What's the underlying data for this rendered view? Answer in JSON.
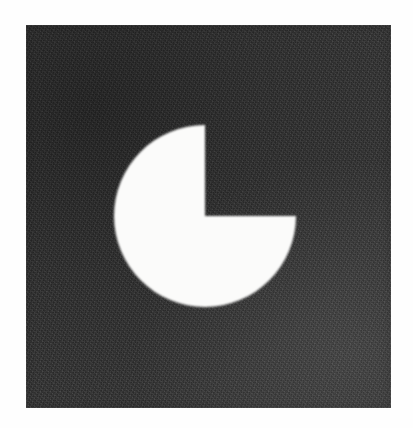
{
  "figure": {
    "canvas": {
      "width": 413,
      "height": 428,
      "paper_color": "#fefefe"
    },
    "panel": {
      "name": "dark-panel",
      "x": 26,
      "y": 25,
      "width": 365,
      "height": 383,
      "fill_color": "#363636",
      "texture": "scan-grain"
    },
    "shape": {
      "name": "pac-man",
      "type": "circle-with-wedge-removed",
      "fill_color": "#fbfbfa",
      "center_x": 205,
      "center_y": 216,
      "radius": 91,
      "sweep_degrees": 270,
      "missing_wedge_degrees": 90,
      "missing_wedge_start_deg": 0,
      "missing_wedge_end_deg": 90,
      "missing_wedge_quadrant": "upper-right"
    }
  },
  "chart_data": {
    "type": "pie",
    "title": "",
    "categories": [
      "Filled",
      "Removed"
    ],
    "values": [
      75,
      25
    ],
    "colors": [
      "#fbfbfa",
      "#363636"
    ],
    "start_angle_deg": 0,
    "direction": "clockwise",
    "legend": "none",
    "grid": false,
    "annotations": []
  }
}
